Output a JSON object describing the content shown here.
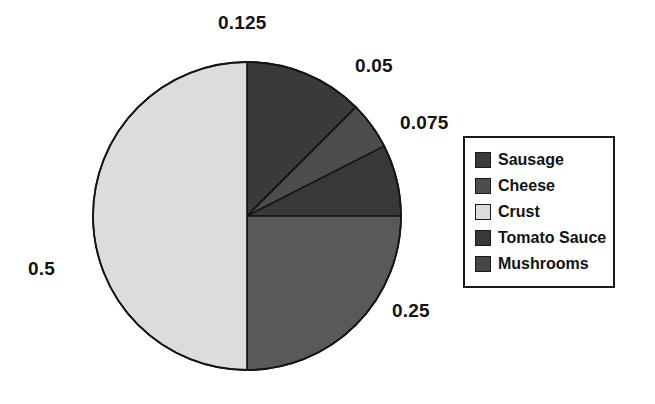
{
  "chart_data": {
    "type": "pie",
    "title": "",
    "labels": [
      "Sausage",
      "Cheese",
      "Tomato Sauce",
      "Mushrooms",
      "Crust"
    ],
    "values": [
      0.125,
      0.05,
      0.075,
      0.25,
      0.5
    ],
    "value_labels": [
      "0.125",
      "0.05",
      "0.075",
      "0.25",
      "0.5"
    ],
    "colors": [
      "#3a3a3a",
      "#4d4d4d",
      "#383838",
      "#595959",
      "#dcdcdc"
    ],
    "start_angle_deg": 0,
    "direction": "clockwise",
    "legend_position": "right",
    "grid": false,
    "outline_color": "#141414"
  },
  "legend": {
    "entries": [
      {
        "label": "Sausage",
        "color": "#3a3a3a"
      },
      {
        "label": "Cheese",
        "color": "#4d4d4d"
      },
      {
        "label": "Crust",
        "color": "#dcdcdc"
      },
      {
        "label": "Tomato Sauce",
        "color": "#383838"
      },
      {
        "label": "Mushrooms",
        "color": "#474747"
      }
    ]
  },
  "value_labels": [
    {
      "text": "0.125",
      "left": 218,
      "top": 12
    },
    {
      "text": "0.05",
      "left": 355,
      "top": 55
    },
    {
      "text": "0.075",
      "left": 400,
      "top": 112
    },
    {
      "text": "0.25",
      "left": 392,
      "top": 300
    },
    {
      "text": "0.5",
      "left": 28,
      "top": 258
    }
  ],
  "geometry": {
    "center_x": 247,
    "center_y": 216,
    "radius": 154
  }
}
